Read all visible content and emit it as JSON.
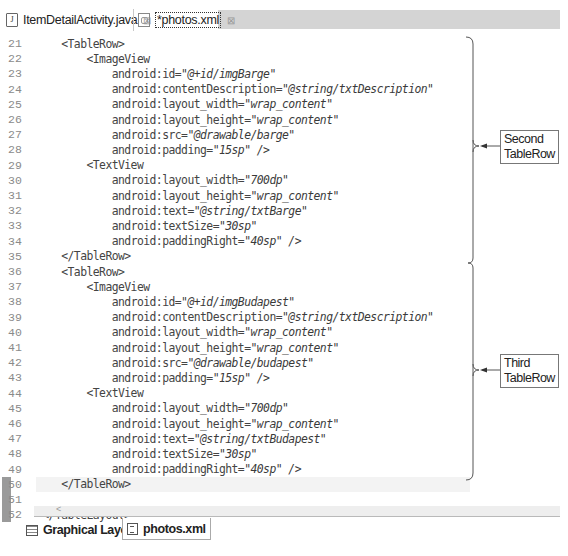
{
  "editor_tabs": [
    {
      "label": "ItemDetailActivity.java",
      "icon": "java-file-icon",
      "active": false,
      "close": "⊠"
    },
    {
      "label": "*photos.xml",
      "icon": "xml-file-icon",
      "active": true,
      "close": "⊠"
    }
  ],
  "code_lines": [
    {
      "n": "21",
      "indent": "    ",
      "parts": [
        [
          "t",
          "<TableRow>"
        ]
      ]
    },
    {
      "n": "22",
      "indent": "        ",
      "parts": [
        [
          "t",
          "<ImageView"
        ]
      ]
    },
    {
      "n": "23",
      "indent": "            ",
      "parts": [
        [
          "t",
          "android:id="
        ],
        [
          "v",
          "\"@+id/imgBarge\""
        ]
      ]
    },
    {
      "n": "24",
      "indent": "            ",
      "parts": [
        [
          "t",
          "android:contentDescription="
        ],
        [
          "v",
          "\"@string/txtDescription\""
        ]
      ]
    },
    {
      "n": "25",
      "indent": "            ",
      "parts": [
        [
          "t",
          "android:layout_width="
        ],
        [
          "v",
          "\"wrap_content\""
        ]
      ]
    },
    {
      "n": "26",
      "indent": "            ",
      "parts": [
        [
          "t",
          "android:layout_height="
        ],
        [
          "v",
          "\"wrap_content\""
        ]
      ]
    },
    {
      "n": "27",
      "indent": "            ",
      "parts": [
        [
          "t",
          "android:src="
        ],
        [
          "v",
          "\"@drawable/barge\""
        ]
      ]
    },
    {
      "n": "28",
      "indent": "            ",
      "parts": [
        [
          "t",
          "android:padding="
        ],
        [
          "v",
          "\"15sp\" />"
        ]
      ]
    },
    {
      "n": "29",
      "indent": "        ",
      "parts": [
        [
          "t",
          "<TextView"
        ]
      ]
    },
    {
      "n": "30",
      "indent": "            ",
      "parts": [
        [
          "t",
          "android:layout_width="
        ],
        [
          "v",
          "\"700dp\""
        ]
      ]
    },
    {
      "n": "31",
      "indent": "            ",
      "parts": [
        [
          "t",
          "android:layout_height="
        ],
        [
          "v",
          "\"wrap_content\""
        ]
      ]
    },
    {
      "n": "32",
      "indent": "            ",
      "parts": [
        [
          "t",
          "android:text="
        ],
        [
          "v",
          "\"@string/txtBarge\""
        ]
      ]
    },
    {
      "n": "33",
      "indent": "            ",
      "parts": [
        [
          "t",
          "android:textSize="
        ],
        [
          "v",
          "\"30sp\""
        ]
      ]
    },
    {
      "n": "34",
      "indent": "            ",
      "parts": [
        [
          "t",
          "android:paddingRight="
        ],
        [
          "v",
          "\"40sp\" />"
        ]
      ]
    },
    {
      "n": "35",
      "indent": "    ",
      "parts": [
        [
          "t",
          "</TableRow>"
        ]
      ]
    },
    {
      "n": "36",
      "indent": "    ",
      "parts": [
        [
          "t",
          "<TableRow>"
        ]
      ]
    },
    {
      "n": "37",
      "indent": "        ",
      "parts": [
        [
          "t",
          "<ImageView"
        ]
      ]
    },
    {
      "n": "38",
      "indent": "            ",
      "parts": [
        [
          "t",
          "android:id="
        ],
        [
          "v",
          "\"@+id/imgBudapest\""
        ]
      ]
    },
    {
      "n": "39",
      "indent": "            ",
      "parts": [
        [
          "t",
          "android:contentDescription="
        ],
        [
          "v",
          "\"@string/txtDescription\""
        ]
      ]
    },
    {
      "n": "40",
      "indent": "            ",
      "parts": [
        [
          "t",
          "android:layout_width="
        ],
        [
          "v",
          "\"wrap_content\""
        ]
      ]
    },
    {
      "n": "41",
      "indent": "            ",
      "parts": [
        [
          "t",
          "android:layout_height="
        ],
        [
          "v",
          "\"wrap_content\""
        ]
      ]
    },
    {
      "n": "42",
      "indent": "            ",
      "parts": [
        [
          "t",
          "android:src="
        ],
        [
          "v",
          "\"@drawable/budapest\""
        ]
      ]
    },
    {
      "n": "43",
      "indent": "            ",
      "parts": [
        [
          "t",
          "android:padding="
        ],
        [
          "v",
          "\"15sp\" />"
        ]
      ]
    },
    {
      "n": "44",
      "indent": "        ",
      "parts": [
        [
          "t",
          "<TextView"
        ]
      ]
    },
    {
      "n": "45",
      "indent": "            ",
      "parts": [
        [
          "t",
          "android:layout_width="
        ],
        [
          "v",
          "\"700dp\""
        ]
      ]
    },
    {
      "n": "46",
      "indent": "            ",
      "parts": [
        [
          "t",
          "android:layout_height="
        ],
        [
          "v",
          "\"wrap_content\""
        ]
      ]
    },
    {
      "n": "47",
      "indent": "            ",
      "parts": [
        [
          "t",
          "android:text="
        ],
        [
          "v",
          "\"@string/txtBudapest\""
        ]
      ]
    },
    {
      "n": "48",
      "indent": "            ",
      "parts": [
        [
          "t",
          "android:textSize="
        ],
        [
          "v",
          "\"30sp\""
        ]
      ]
    },
    {
      "n": "49",
      "indent": "            ",
      "parts": [
        [
          "t",
          "android:paddingRight="
        ],
        [
          "v",
          "\"40sp\" />"
        ]
      ]
    },
    {
      "n": "50",
      "indent": "    ",
      "parts": [
        [
          "t",
          "</TableRow>"
        ]
      ],
      "marked": true,
      "highlight": true
    },
    {
      "n": "51",
      "indent": "",
      "parts": [],
      "marked": true
    },
    {
      "n": "52",
      "indent": " ",
      "parts": [
        [
          "t",
          "</TableLayout>"
        ]
      ],
      "marked": true
    }
  ],
  "scrollbar": {
    "left_arrow": "<"
  },
  "annotations": {
    "second": {
      "label_line1": "Second",
      "label_line2": "TableRow"
    },
    "third": {
      "label_line1": "Third",
      "label_line2": "TableRow"
    }
  },
  "bottom_tabs": [
    {
      "label": "Graphical Layout",
      "icon": "graphical-layout-icon",
      "active": false
    },
    {
      "label": "photos.xml",
      "icon": "xml-source-icon",
      "active": true
    }
  ]
}
